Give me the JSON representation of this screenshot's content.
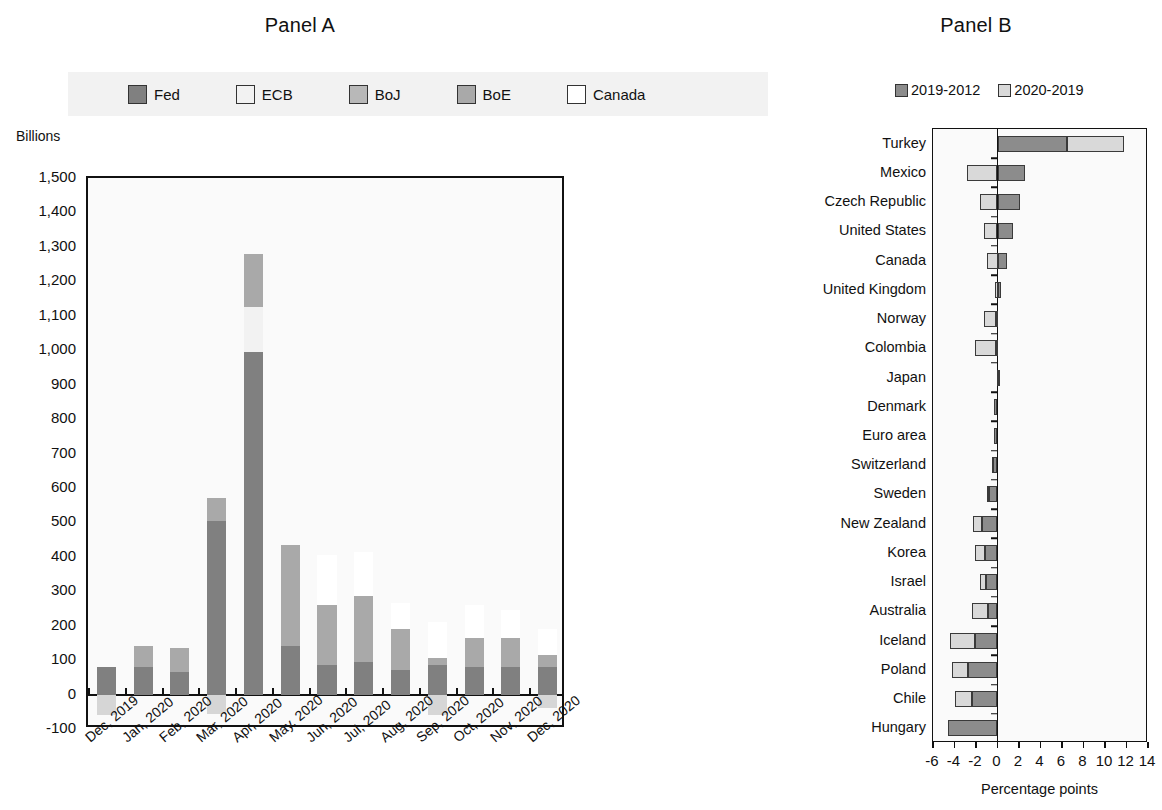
{
  "panelA": {
    "title": "Panel A",
    "axis_title": "Billions",
    "legend": [
      {
        "label": "Fed",
        "color": "#808080"
      },
      {
        "label": "ECB",
        "color": "#f2f2f2"
      },
      {
        "label": "BoJ",
        "color": "#b8b8b8"
      },
      {
        "label": "BoE",
        "color": "#a9a9a9"
      },
      {
        "label": "Canada",
        "color": "#ffffff"
      }
    ]
  },
  "panelB": {
    "title": "Panel B",
    "xlabel": "Percentage points",
    "legend": [
      {
        "label": "2019-2012",
        "color": "#8c8c8c"
      },
      {
        "label": "2020-2019",
        "color": "#d9d9d9"
      }
    ]
  },
  "chart_data": [
    {
      "type": "bar",
      "title": "Panel A",
      "stacked": true,
      "xlabel": "",
      "ylabel": "Billions",
      "ylim": [
        -100,
        1500
      ],
      "yticks": [
        "-100",
        "0",
        "100",
        "200",
        "300",
        "400",
        "500",
        "600",
        "700",
        "800",
        "900",
        "1,000",
        "1,100",
        "1,200",
        "1,300",
        "1,400",
        "1,500"
      ],
      "ytick_values": [
        -100,
        0,
        100,
        200,
        300,
        400,
        500,
        600,
        700,
        800,
        900,
        1000,
        1100,
        1200,
        1300,
        1400,
        1500
      ],
      "grid": false,
      "legend_position": "top",
      "categories": [
        "Dec, 2019",
        "Jan, 2020",
        "Feb, 2020",
        "Mar, 2020",
        "Apr, 2020",
        "May, 2020",
        "Jun, 2020",
        "Jul, 2020",
        "Aug, 2020",
        "Sep, 2020",
        "Oct, 2020",
        "Nov, 2020",
        "Dec, 2020"
      ],
      "series": [
        {
          "name": "Fed",
          "color": "#808080",
          "values": [
            80,
            80,
            65,
            505,
            995,
            140,
            85,
            95,
            70,
            85,
            80,
            80,
            80
          ]
        },
        {
          "name": "ECB",
          "color": "#f2f2f2",
          "values": [
            0,
            0,
            0,
            0,
            130,
            0,
            0,
            0,
            0,
            0,
            0,
            0,
            0
          ]
        },
        {
          "name": "BoJ",
          "color": "#b8b8b8",
          "values": [
            0,
            0,
            0,
            0,
            0,
            0,
            0,
            0,
            0,
            0,
            0,
            0,
            0
          ]
        },
        {
          "name": "BoE",
          "color": "#a9a9a9",
          "values": [
            0,
            60,
            70,
            65,
            155,
            295,
            175,
            190,
            120,
            20,
            85,
            85,
            35
          ]
        },
        {
          "name": "Canada",
          "color": "#ffffff",
          "values": [
            0,
            0,
            0,
            0,
            0,
            0,
            145,
            130,
            75,
            105,
            95,
            80,
            75
          ]
        }
      ],
      "negative_values": [
        -60,
        0,
        0,
        -55,
        0,
        0,
        0,
        0,
        0,
        -60,
        0,
        0,
        -40
      ]
    },
    {
      "type": "bar",
      "orientation": "horizontal",
      "title": "Panel B",
      "stacked": true,
      "xlabel": "Percentage points",
      "ylabel": "",
      "xlim": [
        -6,
        14
      ],
      "xticks": [
        "-6",
        "-4",
        "-2",
        "0",
        "2",
        "4",
        "6",
        "8",
        "10",
        "12",
        "14"
      ],
      "xtick_values": [
        -6,
        -4,
        -2,
        0,
        2,
        4,
        6,
        8,
        10,
        12,
        14
      ],
      "grid": false,
      "legend_position": "top",
      "categories": [
        "Turkey",
        "Mexico",
        "Czech Republic",
        "United States",
        "Canada",
        "United Kingdom",
        "Norway",
        "Colombia",
        "Japan",
        "Denmark",
        "Euro area",
        "Switzerland",
        "Sweden",
        "New Zealand",
        "Korea",
        "Israel",
        "Australia",
        "Iceland",
        "Poland",
        "Chile",
        "Hungary"
      ],
      "series": [
        {
          "name": "2019-2012",
          "color": "#8c8c8c",
          "values": [
            6.5,
            2.6,
            2.1,
            1.4,
            0.9,
            0.35,
            -0.15,
            -0.15,
            0.05,
            -0.3,
            -0.35,
            -0.45,
            -0.8,
            -1.4,
            -1.2,
            -1.1,
            -0.85,
            -2.1,
            -2.7,
            -2.4,
            -4.6
          ]
        },
        {
          "name": "2020-2019",
          "color": "#d9d9d9",
          "values": [
            5.3,
            -2.8,
            -1.6,
            -1.3,
            -1.0,
            -0.25,
            -1.1,
            -1.9,
            -0.05,
            0.0,
            0.0,
            -0.1,
            -0.15,
            -0.9,
            -0.9,
            -0.5,
            -1.5,
            -2.3,
            -1.5,
            -1.6,
            0.0
          ]
        }
      ]
    }
  ]
}
